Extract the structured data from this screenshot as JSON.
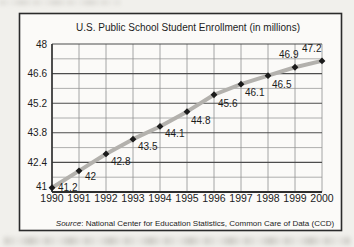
{
  "chart_data": {
    "type": "line",
    "title": "U.S. Public School Student Enrollment (in millions)",
    "x": [
      1990,
      1991,
      1992,
      1993,
      1994,
      1995,
      1996,
      1997,
      1998,
      1999,
      2000
    ],
    "x_tick_labels": [
      "1990",
      "1991",
      "1992",
      "1993",
      "1994",
      "1995",
      "1996",
      "1997",
      "1998",
      "1999",
      "2000"
    ],
    "values": [
      41.2,
      42,
      42.8,
      43.5,
      44.1,
      44.8,
      45.6,
      46.1,
      46.5,
      46.9,
      47.2
    ],
    "point_labels": [
      "41.2",
      "42",
      "42.8",
      "43.5",
      "44.1",
      "44.8",
      "45.6",
      "46.1",
      "46.5",
      "46.9",
      "47.2"
    ],
    "ylim": [
      41,
      48
    ],
    "y_major_ticks": [
      48,
      46.6,
      45.2,
      43.8,
      42.4,
      41
    ],
    "y_major_tick_labels": [
      "48",
      "46.6",
      "45.2",
      "43.8",
      "42.4",
      "41"
    ],
    "y_minor_grid_step": 0.7,
    "grid": "on",
    "legend": "none",
    "source_label": "Source",
    "source_rest": ": National Center for Education Statistics, Common Care of Data (CCD)",
    "marker": "diamond",
    "label_offsets": [
      [
        6,
        3
      ],
      [
        6,
        9
      ],
      [
        5,
        11
      ],
      [
        5,
        11
      ],
      [
        5,
        11
      ],
      [
        4,
        12
      ],
      [
        4,
        12
      ],
      [
        4,
        12
      ],
      [
        4,
        12
      ],
      [
        -16,
        -9
      ],
      [
        -20,
        -9
      ]
    ],
    "colors": {
      "line": "#b3b1ad",
      "marker": "#1b1b1b",
      "grid_major": "#4d4d4d",
      "grid_minor": "#9b9b9b",
      "grid_vertical": "#8f8f8f",
      "axis": "#2e2e2e",
      "frame_border": "#2b2b2b",
      "chart_bg": "#fbfaf8",
      "paper_bg": "#f1f0ec",
      "text": "#1c1c1c"
    }
  }
}
